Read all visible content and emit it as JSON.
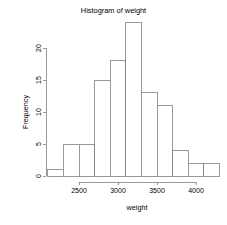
{
  "chart_data": {
    "type": "bar",
    "title": "Histogram of weight",
    "xlabel": "weight",
    "ylabel": "Frequency",
    "categories": [
      "2100",
      "2300",
      "2500",
      "2700",
      "2900",
      "3100",
      "3300",
      "3500",
      "3700",
      "3900",
      "4100"
    ],
    "bin_starts": [
      2100,
      2300,
      2500,
      2700,
      2900,
      3100,
      3300,
      3500,
      3700,
      3900,
      4100
    ],
    "bin_width": 200,
    "values": [
      1,
      5,
      5,
      15,
      18,
      24,
      13,
      11,
      4,
      2,
      2
    ],
    "xlim": [
      2100,
      4300
    ],
    "ylim": [
      0,
      24
    ],
    "x_ticks": [
      2500,
      3000,
      3500,
      4000
    ],
    "x_tick_labels": [
      "2500",
      "3000",
      "3500",
      "4000"
    ],
    "y_ticks": [
      0,
      5,
      10,
      15,
      20
    ],
    "y_tick_labels": [
      "0",
      "5",
      "10",
      "15",
      "20"
    ],
    "grid": false,
    "legend": null,
    "bar_fill_color": "#ffffff",
    "bar_border_color": "#808080",
    "axis_color": "#808080",
    "text_color": "#000000",
    "background_color": "#ffffff"
  },
  "geometry": {
    "plot_left": 46,
    "plot_right": 213,
    "baseline_y": 176,
    "y_top_value_y": 48,
    "x_origin_px": 47.0,
    "x_scale_px_per_unit": 0.0781,
    "y_scale_px_per_unit": 6.4
  }
}
